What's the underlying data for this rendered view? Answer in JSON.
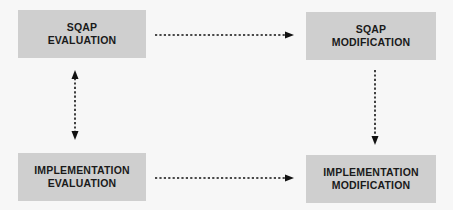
{
  "diagram": {
    "nodes": [
      {
        "id": "sqap-evaluation",
        "lines": [
          "SQAP",
          "EVALUATION"
        ]
      },
      {
        "id": "sqap-modification",
        "lines": [
          "SQAP",
          "MODIFICATION"
        ]
      },
      {
        "id": "implementation-evaluation",
        "lines": [
          "IMPLEMENTATION",
          "EVALUATION"
        ]
      },
      {
        "id": "implementation-modification",
        "lines": [
          "IMPLEMENTATION",
          "MODIFICATION"
        ]
      }
    ],
    "edges": [
      {
        "from": "sqap-evaluation",
        "to": "sqap-modification",
        "style": "dotted",
        "direction": "forward"
      },
      {
        "from": "sqap-evaluation",
        "to": "implementation-evaluation",
        "style": "dotted",
        "direction": "both"
      },
      {
        "from": "sqap-modification",
        "to": "implementation-modification",
        "style": "dotted",
        "direction": "forward"
      },
      {
        "from": "implementation-evaluation",
        "to": "implementation-modification",
        "style": "dotted",
        "direction": "forward"
      }
    ],
    "colors": {
      "box_fill": "#cfcfcf",
      "text": "#1a1a1a",
      "arrow": "#111111",
      "background": "#f7f7f7"
    }
  }
}
